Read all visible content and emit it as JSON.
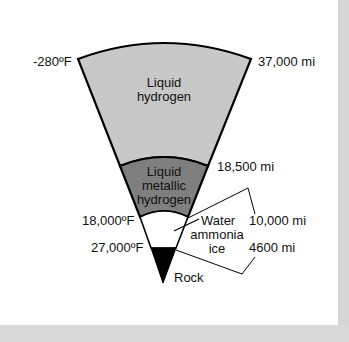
{
  "diagram": {
    "title": "",
    "layers": [
      {
        "id": "liquid-hydrogen",
        "label_line1": "Liquid",
        "label_line2": "hydrogen",
        "fill": "#c8c8c8"
      },
      {
        "id": "liquid-metallic-hydrogen",
        "label_line1": "Liquid",
        "label_line2": "metallic",
        "label_line3": "hydrogen",
        "fill": "#7f7f7f"
      },
      {
        "id": "water-ammonia-ice",
        "label_line1": "Water",
        "label_line2": "ammonia",
        "label_line3": "ice",
        "fill": "#ffffff"
      },
      {
        "id": "rock",
        "label": "Rock",
        "fill": "#000000"
      }
    ],
    "temperatures": {
      "outer": "-280ºF",
      "ice_top": "18,000ºF",
      "rock_top": "27,000ºF"
    },
    "radii": {
      "outer": "37,000 mi",
      "metallic_top": "18,500 mi",
      "ice_top": "10,000 mi",
      "rock_top": "4600 mi"
    }
  }
}
